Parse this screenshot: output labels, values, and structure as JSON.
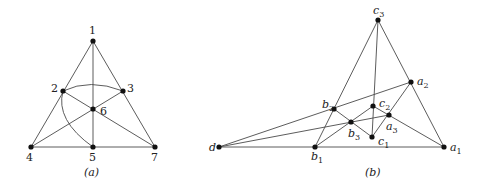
{
  "figure_a": {
    "caption": "(a)",
    "nodes": [
      {
        "id": "1",
        "label": "1",
        "x": 93,
        "y": 41,
        "lx": 89,
        "ly": 34
      },
      {
        "id": "2",
        "label": "2",
        "x": 63,
        "y": 91,
        "lx": 51,
        "ly": 92
      },
      {
        "id": "3",
        "label": "3",
        "x": 123,
        "y": 91,
        "lx": 127,
        "ly": 92
      },
      {
        "id": "6",
        "label": "6",
        "x": 93,
        "y": 109,
        "lx": 100,
        "ly": 115
      },
      {
        "id": "4",
        "label": "4",
        "x": 31,
        "y": 147,
        "lx": 26,
        "ly": 161
      },
      {
        "id": "5",
        "label": "5",
        "x": 93,
        "y": 147,
        "lx": 89,
        "ly": 161
      },
      {
        "id": "7",
        "label": "7",
        "x": 155,
        "y": 147,
        "lx": 151,
        "ly": 161
      }
    ],
    "lines": [
      [
        "1",
        "4"
      ],
      [
        "1",
        "7"
      ],
      [
        "4",
        "7"
      ],
      [
        "1",
        "5"
      ],
      [
        "2",
        "7"
      ],
      [
        "3",
        "4"
      ]
    ],
    "curves": [
      {
        "from": "2",
        "to": "3",
        "path": "M63,91 Q90,78 123,91"
      },
      {
        "from": "2",
        "to": "5",
        "path": "M63,91 Q55,120 93,147"
      }
    ]
  },
  "figure_b": {
    "caption": "(b)",
    "nodes": [
      {
        "id": "c3",
        "label": "c",
        "sub": "3",
        "x": 378,
        "y": 20,
        "lx": 373,
        "ly": 14
      },
      {
        "id": "a2",
        "label": "a",
        "sub": "2",
        "x": 411,
        "y": 82,
        "lx": 417,
        "ly": 85
      },
      {
        "id": "b2",
        "label": "b",
        "sub": "2",
        "x": 334,
        "y": 109,
        "lx": 322,
        "ly": 108
      },
      {
        "id": "c2",
        "label": "c",
        "sub": "2",
        "x": 373,
        "y": 106,
        "lx": 379,
        "ly": 107
      },
      {
        "id": "a3",
        "label": "a",
        "sub": "3",
        "x": 389,
        "y": 115,
        "lx": 386,
        "ly": 130
      },
      {
        "id": "b3",
        "label": "b",
        "sub": "3",
        "x": 351,
        "y": 122,
        "lx": 348,
        "ly": 137
      },
      {
        "id": "c1",
        "label": "c",
        "sub": "1",
        "x": 372,
        "y": 137,
        "lx": 378,
        "ly": 145
      },
      {
        "id": "d",
        "label": "d",
        "sub": "",
        "x": 219,
        "y": 147,
        "lx": 209,
        "ly": 151
      },
      {
        "id": "b1",
        "label": "b",
        "sub": "1",
        "x": 315,
        "y": 147,
        "lx": 311,
        "ly": 160
      },
      {
        "id": "a1",
        "label": "a",
        "sub": "1",
        "x": 444,
        "y": 147,
        "lx": 450,
        "ly": 151
      }
    ],
    "lines": [
      [
        "c3",
        "b1"
      ],
      [
        "c3",
        "a1"
      ],
      [
        "c3",
        "c1"
      ],
      [
        "d",
        "a1"
      ],
      [
        "d",
        "a2"
      ],
      [
        "d",
        "a3"
      ],
      [
        "b2",
        "c1"
      ],
      [
        "b1",
        "c2"
      ],
      [
        "c1",
        "a2"
      ],
      [
        "c2",
        "a1"
      ]
    ]
  }
}
